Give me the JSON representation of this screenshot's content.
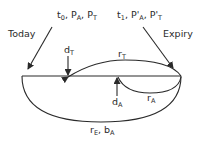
{
  "diagram": {
    "labels": {
      "today": "Today",
      "expiry": "Expiry",
      "start": {
        "t": "t",
        "t_sub": "0",
        "pa": "P",
        "pa_sub": "A",
        "pt": "P",
        "pt_sub": "T",
        "sep": ", "
      },
      "end": {
        "t": "t",
        "t_sub": "1",
        "pa": "P'",
        "pa_sub": "A",
        "pt": "P'",
        "pt_sub": "T",
        "sep": ", "
      },
      "dT": {
        "main": "d",
        "sub": "T"
      },
      "rT": {
        "main": "r",
        "sub": "T"
      },
      "dA": {
        "main": "d",
        "sub": "A"
      },
      "rA": {
        "main": "r",
        "sub": "A"
      },
      "bottom": {
        "r": "r",
        "r_sub": "E",
        "sep": ", ",
        "b": "b",
        "b_sub": "A"
      }
    },
    "colors": {
      "line": "#2a2a2a",
      "background": "#ffffff"
    }
  }
}
